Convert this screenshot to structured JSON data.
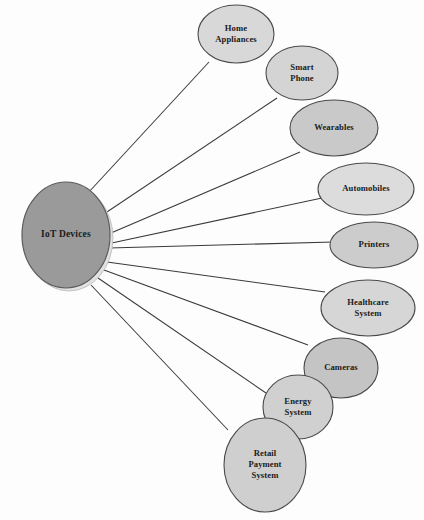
{
  "diagram": {
    "title": "IoT Devices",
    "type": "hub-and-spoke",
    "background_color": "#fdfdfd",
    "edge_color": "#3a3a3a",
    "hub": {
      "id": "iot-devices",
      "label": "IoT Devices",
      "lines": [
        "IoT Devices"
      ],
      "cx": 66,
      "cy": 235,
      "rx": 44,
      "ry": 53,
      "fill": "#9a9a9a",
      "stroke": "#5c5c5c"
    },
    "nodes": [
      {
        "id": "home-appliances",
        "label": "Home Appliances",
        "lines": [
          "Home",
          "Appliances"
        ],
        "cx": 236,
        "cy": 34,
        "rx": 38,
        "ry": 29,
        "fill": "#d8d8d8",
        "stroke": "#5a5a5a",
        "edge_from": [
          88,
          193
        ],
        "edge_to": [
          209,
          62
        ]
      },
      {
        "id": "smart-phone",
        "label": "Smart Phone",
        "lines": [
          "Smart",
          "Phone"
        ],
        "cx": 302,
        "cy": 73,
        "rx": 36,
        "ry": 27,
        "fill": "#d4d4d4",
        "stroke": "#4a4a4a",
        "edge_from": [
          98,
          218
        ],
        "edge_to": [
          277,
          98
        ]
      },
      {
        "id": "wearables",
        "label": "Wearables",
        "lines": [
          "Wearables"
        ],
        "cx": 334,
        "cy": 128,
        "rx": 44,
        "ry": 28,
        "fill": "#c9c9c9",
        "stroke": "#4a4a4a",
        "edge_from": [
          104,
          236
        ],
        "edge_to": [
          300,
          152
        ]
      },
      {
        "id": "automobiles",
        "label": "Automobiles",
        "lines": [
          "Automobiles"
        ],
        "cx": 366,
        "cy": 189,
        "rx": 48,
        "ry": 26,
        "fill": "#dcdcdc",
        "stroke": "#4a4a4a",
        "edge_from": [
          107,
          244
        ],
        "edge_to": [
          322,
          198
        ]
      },
      {
        "id": "printers",
        "label": "Printers",
        "lines": [
          "Printers"
        ],
        "cx": 374,
        "cy": 245,
        "rx": 44,
        "ry": 23,
        "fill": "#cccccc",
        "stroke": "#4a4a4a",
        "edge_from": [
          109,
          248
        ],
        "edge_to": [
          334,
          242
        ]
      },
      {
        "id": "healthcare-system",
        "label": "Healthcare System",
        "lines": [
          "Healthcare",
          "System"
        ],
        "cx": 368,
        "cy": 308,
        "rx": 47,
        "ry": 28,
        "fill": "#d6d6d6",
        "stroke": "#4a4a4a",
        "edge_from": [
          107,
          262
        ],
        "edge_to": [
          325,
          292
        ]
      },
      {
        "id": "cameras",
        "label": "Cameras",
        "lines": [
          "Cameras"
        ],
        "cx": 341,
        "cy": 368,
        "rx": 37,
        "ry": 30,
        "fill": "#c4c4c4",
        "stroke": "#4a4a4a",
        "edge_from": [
          104,
          270
        ],
        "edge_to": [
          308,
          345
        ]
      },
      {
        "id": "energy-system",
        "label": "Energy System",
        "lines": [
          "Energy",
          "System"
        ],
        "cx": 298,
        "cy": 407,
        "rx": 35,
        "ry": 32,
        "fill": "#d0d0d0",
        "stroke": "#4a4a4a",
        "edge_from": [
          98,
          278
        ],
        "edge_to": [
          266,
          393
        ]
      },
      {
        "id": "retail-payment-system",
        "label": "Retail Payment System",
        "lines": [
          "Retail",
          "Payment",
          "System"
        ],
        "cx": 265,
        "cy": 465,
        "rx": 41,
        "ry": 47,
        "fill": "#cfcfcf",
        "stroke": "#4a4a4a",
        "edge_from": [
          91,
          285
        ],
        "edge_to": [
          228,
          430
        ]
      }
    ]
  }
}
